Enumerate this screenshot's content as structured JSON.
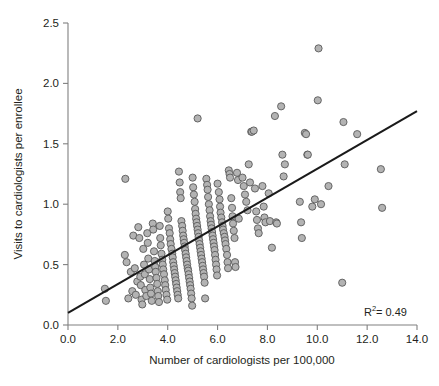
{
  "chart_data": {
    "type": "scatter",
    "title": "",
    "xlabel": "Number of cardiologists per 100,000",
    "ylabel": "Visits to cardiologists per enrollee",
    "xlim": [
      0.0,
      14.0
    ],
    "ylim": [
      0.0,
      2.5
    ],
    "xticks": [
      "0.0",
      "2.0",
      "4.0",
      "6.0",
      "8.0",
      "10.0",
      "12.0",
      "14.0"
    ],
    "yticks": [
      "0.0",
      "0.5",
      "1.0",
      "1.5",
      "2.0",
      "2.5"
    ],
    "xtick_values": [
      0.0,
      2.0,
      4.0,
      6.0,
      8.0,
      10.0,
      12.0,
      14.0
    ],
    "ytick_values": [
      0.0,
      0.5,
      1.0,
      1.5,
      2.0,
      2.5
    ],
    "grid": false,
    "legend": null,
    "annotations": [
      {
        "name": "r-squared",
        "text": "R2 = 0.49",
        "text_main": "R",
        "text_sup": "2",
        "text_rest": " = 0.49",
        "x": 12.6,
        "y": 0.14
      }
    ],
    "trendline": {
      "name": "linear-fit",
      "x0": 0.0,
      "y0": 0.1,
      "x1": 14.0,
      "y1": 1.77,
      "color": "#1a1a1a",
      "width": 2.1
    },
    "marker_style": {
      "fill": "#b3b3b3",
      "stroke": "#5a5a5a",
      "radius": 3.6,
      "stroke_width": 0.9
    },
    "series": [
      {
        "name": "hospital-referral-regions",
        "points": [
          [
            1.48,
            0.3
          ],
          [
            1.52,
            0.2
          ],
          [
            2.3,
            1.21
          ],
          [
            2.28,
            0.58
          ],
          [
            2.35,
            0.52
          ],
          [
            2.42,
            0.22
          ],
          [
            2.52,
            0.44
          ],
          [
            2.58,
            0.28
          ],
          [
            2.62,
            0.74
          ],
          [
            2.68,
            0.47
          ],
          [
            2.72,
            0.25
          ],
          [
            2.78,
            0.36
          ],
          [
            2.82,
            0.81
          ],
          [
            2.86,
            0.72
          ],
          [
            2.9,
            0.4
          ],
          [
            2.92,
            0.33
          ],
          [
            2.95,
            0.21
          ],
          [
            2.98,
            0.17
          ],
          [
            3.02,
            0.63
          ],
          [
            3.05,
            0.5
          ],
          [
            3.08,
            0.42
          ],
          [
            3.1,
            0.29
          ],
          [
            3.14,
            0.24
          ],
          [
            3.18,
            0.76
          ],
          [
            3.2,
            0.68
          ],
          [
            3.22,
            0.55
          ],
          [
            3.25,
            0.46
          ],
          [
            3.28,
            0.38
          ],
          [
            3.3,
            0.31
          ],
          [
            3.33,
            0.26
          ],
          [
            3.36,
            0.2
          ],
          [
            3.4,
            0.84
          ],
          [
            3.42,
            0.79
          ],
          [
            3.45,
            0.61
          ],
          [
            3.48,
            0.53
          ],
          [
            3.5,
            0.48
          ],
          [
            3.52,
            0.44
          ],
          [
            3.55,
            0.39
          ],
          [
            3.58,
            0.34
          ],
          [
            3.6,
            0.28
          ],
          [
            3.62,
            0.24
          ],
          [
            3.65,
            0.19
          ],
          [
            3.68,
            0.82
          ],
          [
            3.7,
            0.72
          ],
          [
            3.72,
            0.66
          ],
          [
            3.75,
            0.59
          ],
          [
            3.78,
            0.54
          ],
          [
            3.8,
            0.5
          ],
          [
            3.82,
            0.46
          ],
          [
            3.85,
            0.42
          ],
          [
            3.88,
            0.37
          ],
          [
            3.9,
            0.33
          ],
          [
            3.92,
            0.29
          ],
          [
            3.95,
            0.25
          ],
          [
            3.98,
            0.21
          ],
          [
            4.0,
            0.94
          ],
          [
            4.02,
            0.88
          ],
          [
            4.05,
            0.8
          ],
          [
            4.08,
            0.76
          ],
          [
            4.1,
            0.71
          ],
          [
            4.12,
            0.67
          ],
          [
            4.15,
            0.63
          ],
          [
            4.18,
            0.59
          ],
          [
            4.2,
            0.56
          ],
          [
            4.22,
            0.52
          ],
          [
            4.24,
            0.49
          ],
          [
            4.26,
            0.46
          ],
          [
            4.28,
            0.43
          ],
          [
            4.3,
            0.4
          ],
          [
            4.32,
            0.37
          ],
          [
            4.34,
            0.34
          ],
          [
            4.36,
            0.31
          ],
          [
            4.38,
            0.28
          ],
          [
            4.4,
            0.25
          ],
          [
            4.42,
            0.22
          ],
          [
            4.45,
            1.27
          ],
          [
            4.48,
            1.18
          ],
          [
            4.5,
            1.1
          ],
          [
            4.52,
            1.05
          ],
          [
            4.55,
            0.86
          ],
          [
            4.58,
            0.82
          ],
          [
            4.6,
            0.78
          ],
          [
            4.62,
            0.74
          ],
          [
            4.64,
            0.71
          ],
          [
            4.66,
            0.68
          ],
          [
            4.68,
            0.65
          ],
          [
            4.7,
            0.62
          ],
          [
            4.72,
            0.59
          ],
          [
            4.74,
            0.56
          ],
          [
            4.76,
            0.53
          ],
          [
            4.78,
            0.5
          ],
          [
            4.8,
            0.47
          ],
          [
            4.82,
            0.45
          ],
          [
            4.84,
            0.42
          ],
          [
            4.86,
            0.39
          ],
          [
            4.88,
            0.36
          ],
          [
            4.9,
            0.33
          ],
          [
            4.92,
            0.3
          ],
          [
            4.94,
            0.26
          ],
          [
            4.96,
            0.22
          ],
          [
            4.98,
            0.16
          ],
          [
            5.0,
            1.22
          ],
          [
            5.02,
            1.14
          ],
          [
            5.05,
            1.08
          ],
          [
            5.08,
            1.02
          ],
          [
            5.1,
            0.96
          ],
          [
            5.12,
            0.92
          ],
          [
            5.14,
            0.88
          ],
          [
            5.16,
            0.85
          ],
          [
            5.18,
            0.82
          ],
          [
            5.2,
            0.79
          ],
          [
            5.22,
            0.76
          ],
          [
            5.24,
            0.73
          ],
          [
            5.26,
            0.7
          ],
          [
            5.28,
            0.67
          ],
          [
            5.3,
            0.64
          ],
          [
            5.32,
            0.61
          ],
          [
            5.34,
            0.58
          ],
          [
            5.36,
            0.55
          ],
          [
            5.38,
            0.52
          ],
          [
            5.4,
            0.49
          ],
          [
            5.42,
            0.46
          ],
          [
            5.44,
            0.43
          ],
          [
            5.46,
            0.4
          ],
          [
            5.48,
            0.35
          ],
          [
            5.5,
            0.22
          ],
          [
            5.2,
            1.71
          ],
          [
            5.55,
            1.21
          ],
          [
            5.58,
            1.16
          ],
          [
            5.6,
            1.12
          ],
          [
            5.62,
            1.06
          ],
          [
            5.65,
            1.0
          ],
          [
            5.68,
            0.95
          ],
          [
            5.7,
            0.9
          ],
          [
            5.72,
            0.86
          ],
          [
            5.74,
            0.83
          ],
          [
            5.76,
            0.8
          ],
          [
            5.78,
            0.77
          ],
          [
            5.8,
            0.74
          ],
          [
            5.82,
            0.71
          ],
          [
            5.84,
            0.68
          ],
          [
            5.86,
            0.65
          ],
          [
            5.88,
            0.62
          ],
          [
            5.9,
            0.58
          ],
          [
            5.92,
            0.54
          ],
          [
            5.94,
            0.5
          ],
          [
            5.96,
            0.46
          ],
          [
            5.98,
            0.41
          ],
          [
            6.0,
            1.17
          ],
          [
            6.05,
            1.1
          ],
          [
            6.08,
            1.04
          ],
          [
            6.1,
            0.98
          ],
          [
            6.12,
            0.93
          ],
          [
            6.15,
            0.89
          ],
          [
            6.18,
            0.85
          ],
          [
            6.2,
            0.82
          ],
          [
            6.22,
            0.79
          ],
          [
            6.25,
            0.76
          ],
          [
            6.28,
            0.73
          ],
          [
            6.3,
            0.7
          ],
          [
            6.32,
            0.67
          ],
          [
            6.35,
            0.63
          ],
          [
            6.38,
            0.58
          ],
          [
            6.4,
            0.52
          ],
          [
            6.42,
            0.47
          ],
          [
            6.45,
            1.28
          ],
          [
            6.48,
            1.25
          ],
          [
            6.5,
            1.22
          ],
          [
            6.55,
            1.05
          ],
          [
            6.58,
            0.97
          ],
          [
            6.6,
            0.9
          ],
          [
            6.62,
            0.84
          ],
          [
            6.65,
            0.78
          ],
          [
            6.68,
            0.72
          ],
          [
            6.7,
            0.52
          ],
          [
            6.72,
            0.48
          ],
          [
            6.78,
            1.26
          ],
          [
            6.82,
            1.2
          ],
          [
            6.85,
            0.88
          ],
          [
            7.0,
            1.22
          ],
          [
            7.05,
            1.15
          ],
          [
            7.1,
            1.08
          ],
          [
            7.15,
            1.02
          ],
          [
            7.2,
            0.95
          ],
          [
            7.25,
            1.33
          ],
          [
            7.3,
            1.18
          ],
          [
            7.35,
            1.6
          ],
          [
            7.38,
            1.6
          ],
          [
            7.45,
            1.61
          ],
          [
            7.5,
            1.13
          ],
          [
            7.55,
            0.94
          ],
          [
            7.58,
            0.87
          ],
          [
            7.62,
            0.8
          ],
          [
            7.65,
            0.76
          ],
          [
            7.8,
            1.15
          ],
          [
            7.85,
            0.98
          ],
          [
            7.88,
            0.89
          ],
          [
            7.92,
            0.85
          ],
          [
            8.05,
            1.09
          ],
          [
            8.1,
            0.86
          ],
          [
            8.18,
            0.64
          ],
          [
            8.3,
            1.73
          ],
          [
            8.35,
            0.85
          ],
          [
            8.38,
            0.84
          ],
          [
            8.55,
            1.81
          ],
          [
            8.6,
            1.41
          ],
          [
            8.65,
            1.23
          ],
          [
            8.7,
            1.33
          ],
          [
            9.3,
            1.02
          ],
          [
            9.35,
            0.85
          ],
          [
            9.38,
            0.72
          ],
          [
            9.5,
            1.59
          ],
          [
            9.55,
            1.58
          ],
          [
            9.6,
            1.41
          ],
          [
            9.62,
            1.41
          ],
          [
            9.8,
            0.98
          ],
          [
            9.9,
            1.04
          ],
          [
            10.02,
            1.86
          ],
          [
            10.05,
            2.29
          ],
          [
            10.15,
            1.0
          ],
          [
            10.45,
            1.15
          ],
          [
            11.0,
            0.35
          ],
          [
            11.05,
            1.68
          ],
          [
            11.1,
            1.33
          ],
          [
            11.6,
            1.58
          ],
          [
            12.55,
            1.29
          ],
          [
            12.6,
            0.97
          ]
        ]
      }
    ]
  },
  "figure": {
    "background": "#ffffff",
    "axis_color": "#808080",
    "text_color": "#231f20"
  },
  "geometry": {
    "plot_left": 68,
    "plot_right": 417,
    "plot_top": 23,
    "plot_bottom": 325
  }
}
